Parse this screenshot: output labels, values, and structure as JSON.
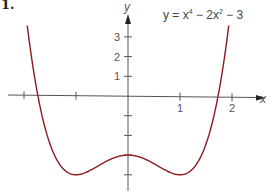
{
  "problem_number": "1.",
  "equation": {
    "lhs": "y = x",
    "exp1": "4",
    "mid": " − 2x",
    "exp2": "2",
    "rhs": " − 3"
  },
  "colors": {
    "curve": "#8b1a1f",
    "axis": "#555555",
    "text": "#444444"
  },
  "chart_data": {
    "type": "line",
    "xlabel": "x",
    "ylabel": "y",
    "x_ticks": [
      -2,
      -1,
      1,
      2
    ],
    "x_tick_labels": [
      "",
      "",
      "1",
      "2"
    ],
    "y_ticks": [
      -4,
      -3,
      -2,
      -1,
      1,
      2,
      3
    ],
    "y_tick_labels": [
      "",
      "",
      "",
      "",
      "1",
      "2",
      "3"
    ],
    "xlim": [
      -2.5,
      2.7
    ],
    "ylim": [
      -4.6,
      4.2
    ],
    "grid": false,
    "legend": null,
    "series": [
      {
        "name": "y = x^4 - 2x^2 - 3",
        "x": [
          -2.03,
          -2.0,
          -1.9,
          -1.8,
          -1.73,
          -1.6,
          -1.5,
          -1.4,
          -1.3,
          -1.2,
          -1.1,
          -1.0,
          -0.9,
          -0.8,
          -0.7,
          -0.6,
          -0.5,
          -0.4,
          -0.3,
          -0.2,
          -0.1,
          0.0,
          0.1,
          0.2,
          0.3,
          0.4,
          0.5,
          0.6,
          0.7,
          0.8,
          0.9,
          1.0,
          1.1,
          1.2,
          1.3,
          1.4,
          1.5,
          1.6,
          1.73,
          1.8,
          1.9,
          2.0,
          2.03
        ],
        "values": [
          5.74,
          5.0,
          2.81,
          1.02,
          0.0,
          -1.57,
          -2.44,
          -3.08,
          -3.52,
          -3.81,
          -3.96,
          -4.0,
          -3.96,
          -3.87,
          -3.74,
          -3.59,
          -3.44,
          -3.29,
          -3.17,
          -3.08,
          -3.02,
          -3.0,
          -3.02,
          -3.08,
          -3.17,
          -3.29,
          -3.44,
          -3.59,
          -3.74,
          -3.87,
          -3.96,
          -4.0,
          -3.96,
          -3.81,
          -3.52,
          -3.08,
          -2.44,
          -1.57,
          0.0,
          1.02,
          2.81,
          5.0,
          5.74
        ]
      }
    ],
    "annotations": [
      {
        "text": "y = x⁴ − 2x² − 3",
        "position": "top-right"
      }
    ]
  }
}
